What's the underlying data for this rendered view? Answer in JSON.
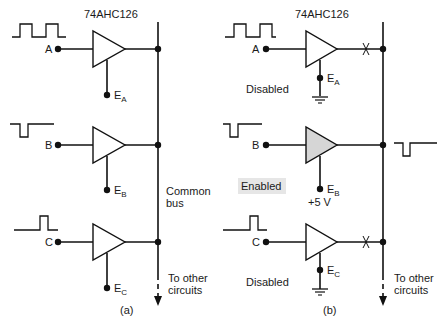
{
  "panels": [
    {
      "id": "a",
      "caption": "(a)",
      "chip": "74AHC126",
      "bus_label_line1": "Common",
      "bus_label_line2": "bus",
      "to_other_line1": "To other",
      "to_other_line2": "circuits",
      "buffers": [
        {
          "input": "A",
          "enable": "E",
          "enable_sub": "A",
          "waveform": "pulse-train"
        },
        {
          "input": "B",
          "enable": "E",
          "enable_sub": "B",
          "waveform": "negative-pulse"
        },
        {
          "input": "C",
          "enable": "E",
          "enable_sub": "C",
          "waveform": "positive-pulse"
        }
      ]
    },
    {
      "id": "b",
      "caption": "(b)",
      "chip": "74AHC126",
      "to_other_line1": "To other",
      "to_other_line2": "circuits",
      "buffers": [
        {
          "input": "A",
          "enable": "E",
          "enable_sub": "A",
          "state": "Disabled",
          "enable_tie": "ground",
          "output_broken": true
        },
        {
          "input": "B",
          "enable": "E",
          "enable_sub": "B",
          "state": "Enabled",
          "enable_tie": "+5 V",
          "output_broken": false,
          "highlight": true
        },
        {
          "input": "C",
          "enable": "E",
          "enable_sub": "C",
          "state": "Disabled",
          "enable_tie": "ground",
          "output_broken": true
        }
      ],
      "bus_output_waveform": "negative-pulse"
    }
  ],
  "colors": {
    "line": "#111111",
    "enabled_fill": "#d6d6d6",
    "enabled_label_bg": "#e6e6e6",
    "background": "#ffffff"
  }
}
